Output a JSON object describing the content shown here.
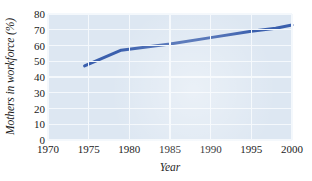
{
  "chart_data": {
    "type": "line",
    "title": "",
    "xlabel": "Year",
    "ylabel": "Mothers in workforce (%)",
    "xlim": [
      1970,
      2000
    ],
    "ylim": [
      0,
      80
    ],
    "grid": true,
    "legend": null,
    "xticks": [
      "1970",
      "1975",
      "1980",
      "1985",
      "1990",
      "1995",
      "2000"
    ],
    "yticks": [
      "0",
      "10",
      "20",
      "30",
      "40",
      "50",
      "60",
      "70",
      "80"
    ],
    "series": [
      {
        "name": "Mothers in workforce",
        "color": "#3a5fad",
        "x": [
          1974.5,
          1979,
          1985,
          1990,
          1995,
          1998,
          2000
        ],
        "values": [
          47,
          57,
          61,
          65,
          69,
          71,
          73
        ]
      }
    ]
  },
  "style": {
    "plot_background": "#dde7f2",
    "gridline_color": "#f4f8fc",
    "line_color": "#3a5fad",
    "text_color": "#1a1a1a",
    "page_background": "#ffffff"
  }
}
